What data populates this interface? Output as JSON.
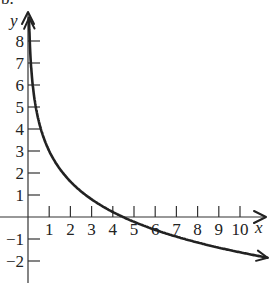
{
  "figure": {
    "corner_fragment": "b."
  },
  "chart_data": {
    "type": "line",
    "title": "",
    "xlabel": "x",
    "ylabel": "y",
    "xlim": [
      0,
      11.5
    ],
    "ylim": [
      -3,
      9
    ],
    "grid": false,
    "legend": null,
    "x_ticks": [
      1,
      2,
      3,
      4,
      5,
      6,
      7,
      8,
      9,
      10
    ],
    "x_tick_labels": [
      "1",
      "2",
      "3",
      "4",
      "5",
      "6",
      "7",
      "8",
      "9",
      "10"
    ],
    "y_ticks": [
      -2,
      -1,
      1,
      2,
      3,
      4,
      5,
      6,
      7,
      8
    ],
    "y_tick_labels": [
      "−2",
      "−1",
      "1",
      "2",
      "3",
      "4",
      "5",
      "6",
      "7",
      "8"
    ],
    "series": [
      {
        "name": "f(x)",
        "description": "Decreasing logarithmic curve, vertical asymptote at x = 0, arrows at both ends",
        "approx_formula": "y = 3 - 2 ln(x)",
        "x": [
          0.02,
          0.05,
          0.1,
          0.25,
          0.5,
          1,
          2,
          3,
          4,
          4.5,
          5,
          6,
          7,
          8,
          9,
          10,
          11.3
        ],
        "y": [
          10.8,
          9.0,
          7.6,
          5.8,
          4.4,
          3.0,
          1.6,
          0.8,
          0.2,
          0.0,
          -0.2,
          -0.6,
          -0.9,
          -1.2,
          -1.4,
          -1.6,
          -1.85
        ]
      }
    ],
    "annotations": [
      "x-intercept near x ≈ 4.5",
      "curve approaches the y-axis asymptotically"
    ]
  }
}
